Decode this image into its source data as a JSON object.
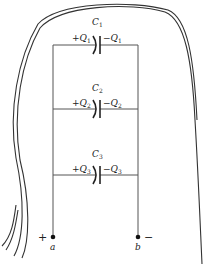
{
  "diagram": {
    "type": "circuit",
    "capacitors": [
      {
        "name": "C",
        "sub": "1",
        "plus_q": "+Q",
        "plus_sub": "1",
        "minus_q": "−Q",
        "minus_sub": "1"
      },
      {
        "name": "C",
        "sub": "2",
        "plus_q": "+Q",
        "plus_sub": "2",
        "minus_q": "−Q",
        "minus_sub": "2"
      },
      {
        "name": "C",
        "sub": "3",
        "plus_q": "+Q",
        "plus_sub": "3",
        "minus_q": "−Q",
        "minus_sub": "3"
      }
    ],
    "terminals": {
      "left": {
        "label": "a",
        "polarity": "+"
      },
      "right": {
        "label": "b",
        "polarity": "−"
      }
    },
    "colors": {
      "wire": "#555555",
      "ink": "#222222",
      "sketch": "#333333",
      "background": "#ffffff"
    }
  }
}
